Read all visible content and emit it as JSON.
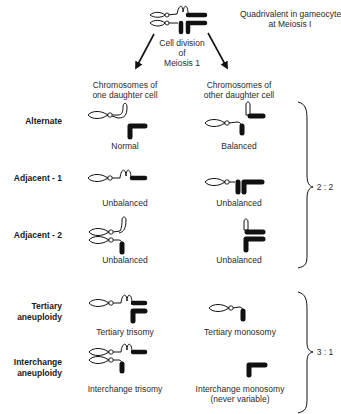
{
  "header": {
    "title_line1": "Quadrivalent in gameocyte",
    "title_line2": "at Meiosis I",
    "division_line1": "Cell division",
    "division_line2": "of",
    "division_line3": "Meiosis 1"
  },
  "columns": {
    "left_line1": "Chromosomes of",
    "left_line2": "one daughter cell",
    "right_line1": "Chromosomes of",
    "right_line2": "other daughter cell"
  },
  "rows": [
    {
      "label": "Alternate",
      "left_caption": "Normal",
      "right_caption": "Balanced"
    },
    {
      "label": "Adjacent - 1",
      "left_caption": "Unbalanced",
      "right_caption": "Unbalanced"
    },
    {
      "label": "Adjacent - 2",
      "left_caption": "Unbalanced",
      "right_caption": "Unbalanced"
    },
    {
      "label_line1": "Tertiary",
      "label_line2": "aneuploidy",
      "left_caption": "Tertiary trisomy",
      "right_caption": "Tertiary monosomy"
    },
    {
      "label_line1": "Interchange",
      "label_line2": "aneuploidy",
      "left_caption": "Interchange trisomy",
      "right_caption_line1": "Interchange monosomy",
      "right_caption_line2": "(never variable)"
    }
  ],
  "groups": [
    {
      "ratio": "2 : 2"
    },
    {
      "ratio": "3 : 1"
    }
  ],
  "icons": {
    "open_chromosome": "white-chromosome-outline",
    "filled_chromosome": "black-chromosome",
    "arrow": "arrow-down"
  }
}
